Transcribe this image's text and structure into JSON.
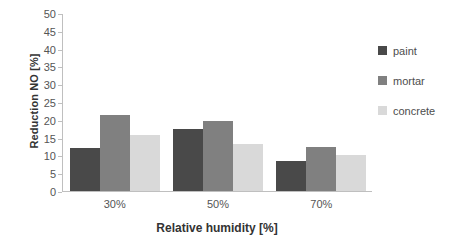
{
  "chart_data": {
    "type": "bar",
    "title": "",
    "xlabel": "Relative humidity [%]",
    "ylabel": "Reduction NO [%]",
    "categories": [
      "30%",
      "50%",
      "70%"
    ],
    "series": [
      {
        "name": "paint",
        "values": [
          12.2,
          17.5,
          8.5
        ],
        "color": "#494949"
      },
      {
        "name": "mortar",
        "values": [
          21.5,
          19.7,
          12.5
        ],
        "color": "#808080"
      },
      {
        "name": "concrete",
        "values": [
          15.8,
          13.4,
          10.3
        ],
        "color": "#d9d9d9"
      }
    ],
    "ylim": [
      0,
      50
    ],
    "ytick_step": 5,
    "yticks": [
      "50",
      "45",
      "40",
      "35",
      "30",
      "25",
      "20",
      "15",
      "10",
      "5",
      "0"
    ],
    "grid": false,
    "legend_position": "right"
  },
  "axes": {
    "y_title": "Reduction NO [%]",
    "x_title": "Relative humidity [%]"
  },
  "legend": {
    "entries": [
      {
        "label": "paint"
      },
      {
        "label": "mortar"
      },
      {
        "label": "concrete"
      }
    ]
  },
  "colors": {
    "paint": "#494949",
    "mortar": "#808080",
    "concrete": "#d9d9d9",
    "axis": "#bfbfbf",
    "text": "#404040",
    "background": "#ffffff"
  }
}
